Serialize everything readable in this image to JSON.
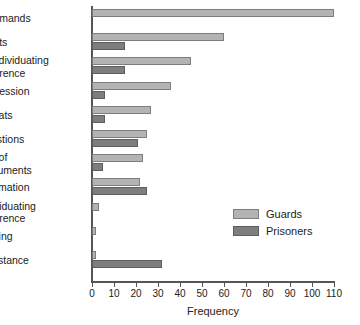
{
  "chart_data": {
    "type": "bar",
    "orientation": "horizontal",
    "title": "",
    "xlabel": "Frequency",
    "ylabel": "",
    "xlim": [
      0,
      110
    ],
    "xticks": [
      0,
      10,
      20,
      30,
      40,
      50,
      60,
      70,
      80,
      90,
      100,
      110
    ],
    "grid": false,
    "legend_position": "inside-right",
    "categories": [
      "Commands",
      "Insults",
      "Deindividuating\nReference",
      "Aggression",
      "Threats",
      "Questions",
      "Use of\nInstruments",
      "Information",
      "Individuating\nReference",
      "Helping",
      "Resistance"
    ],
    "series": [
      {
        "name": "Guards",
        "color": "#b3b3b3",
        "values": [
          110,
          60,
          45,
          36,
          27,
          25,
          23,
          22,
          3,
          2,
          2
        ]
      },
      {
        "name": "Prisoners",
        "color": "#7e7e7e",
        "values": [
          0,
          15,
          15,
          6,
          6,
          21,
          5,
          25,
          0,
          0,
          32
        ]
      }
    ]
  },
  "legend": {
    "items": [
      {
        "label": "Guards"
      },
      {
        "label": "Prisoners"
      }
    ]
  },
  "axis": {
    "x_title": "Frequency"
  }
}
